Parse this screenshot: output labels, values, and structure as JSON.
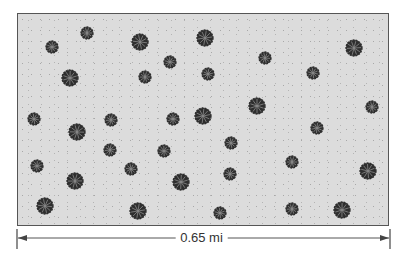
{
  "figure": {
    "scale_label": "0.65 mi",
    "colors": {
      "ground": "#dcdcdc",
      "border": "#555555",
      "tree_dark": "#2e2e2e",
      "tree_light": "#8a8a8a",
      "scale_line": "#444444"
    },
    "tree_count": 35,
    "trees": [
      {
        "x": 87,
        "y": 33,
        "size": "small"
      },
      {
        "x": 52,
        "y": 47,
        "size": "small"
      },
      {
        "x": 140,
        "y": 42,
        "size": "large"
      },
      {
        "x": 205,
        "y": 38,
        "size": "large"
      },
      {
        "x": 170,
        "y": 62,
        "size": "small"
      },
      {
        "x": 145,
        "y": 77,
        "size": "small"
      },
      {
        "x": 70,
        "y": 78,
        "size": "large"
      },
      {
        "x": 265,
        "y": 58,
        "size": "small"
      },
      {
        "x": 208,
        "y": 74,
        "size": "small"
      },
      {
        "x": 313,
        "y": 73,
        "size": "small"
      },
      {
        "x": 354,
        "y": 48,
        "size": "large"
      },
      {
        "x": 257,
        "y": 106,
        "size": "large"
      },
      {
        "x": 372,
        "y": 107,
        "size": "small"
      },
      {
        "x": 203,
        "y": 116,
        "size": "large"
      },
      {
        "x": 34,
        "y": 119,
        "size": "small"
      },
      {
        "x": 111,
        "y": 120,
        "size": "small"
      },
      {
        "x": 173,
        "y": 119,
        "size": "small"
      },
      {
        "x": 77,
        "y": 132,
        "size": "large"
      },
      {
        "x": 317,
        "y": 128,
        "size": "small"
      },
      {
        "x": 231,
        "y": 143,
        "size": "small"
      },
      {
        "x": 110,
        "y": 150,
        "size": "small"
      },
      {
        "x": 164,
        "y": 151,
        "size": "small"
      },
      {
        "x": 292,
        "y": 162,
        "size": "small"
      },
      {
        "x": 37,
        "y": 166,
        "size": "small"
      },
      {
        "x": 131,
        "y": 169,
        "size": "small"
      },
      {
        "x": 230,
        "y": 174,
        "size": "small"
      },
      {
        "x": 368,
        "y": 171,
        "size": "large"
      },
      {
        "x": 75,
        "y": 181,
        "size": "large"
      },
      {
        "x": 181,
        "y": 182,
        "size": "large"
      },
      {
        "x": 45,
        "y": 206,
        "size": "large"
      },
      {
        "x": 138,
        "y": 211,
        "size": "large"
      },
      {
        "x": 220,
        "y": 213,
        "size": "small"
      },
      {
        "x": 292,
        "y": 209,
        "size": "small"
      },
      {
        "x": 342,
        "y": 210,
        "size": "large"
      },
      {
        "x": 257,
        "y": 106,
        "size": "large"
      }
    ]
  }
}
